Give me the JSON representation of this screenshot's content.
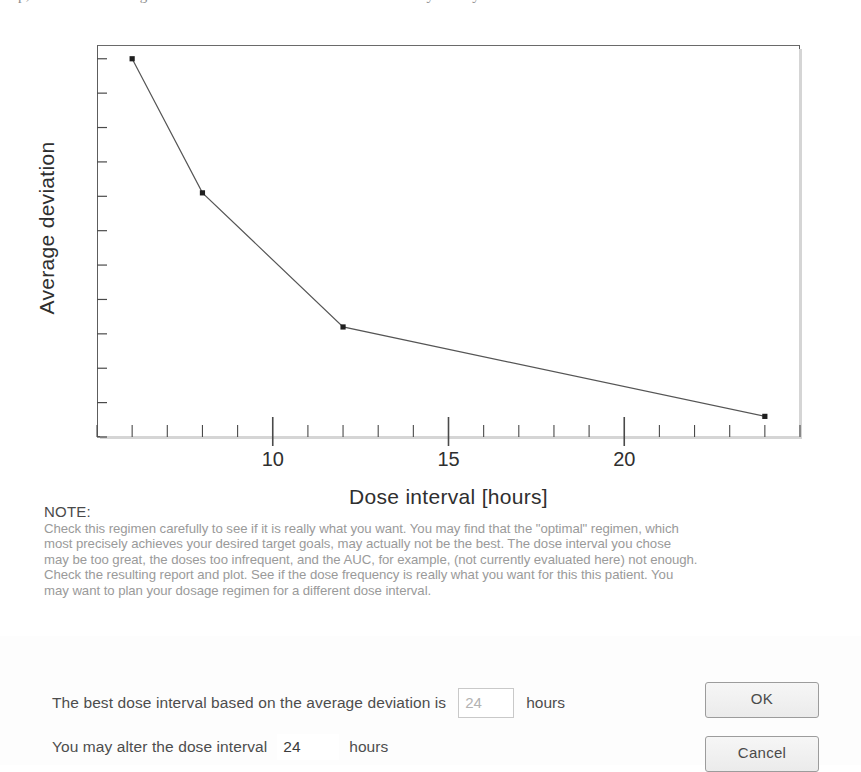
{
  "top_clipped_text": "p, and see the average deviation as a function of the dose interval you may want",
  "chart_data": {
    "type": "line",
    "title": "",
    "xlabel": "Dose interval [hours]",
    "ylabel": "Average deviation",
    "x": [
      6,
      8,
      12,
      24
    ],
    "values": [
      13.3,
      11.35,
      9.4,
      8.1
    ],
    "series": [
      {
        "name": "Average deviation vs dose interval",
        "x": [
          6,
          8,
          12,
          24
        ],
        "values": [
          13.3,
          11.35,
          9.4,
          8.1
        ]
      }
    ],
    "xlim": [
      5,
      25
    ],
    "ylim": [
      7.8,
      13.5
    ],
    "x_tick_labels": [
      "10",
      "15",
      "20"
    ],
    "x_tick_values": [
      10,
      15,
      20
    ],
    "x_minor_tick_step": 1,
    "y_tick_labels": [
      "8",
      "9",
      "10",
      "11",
      "12",
      "13"
    ],
    "y_tick_values": [
      8,
      9,
      10,
      11,
      12,
      13
    ],
    "y_minor_tick_step": 0.5,
    "grid": false,
    "legend": "none",
    "marker": "filled-square",
    "line_color": "#555555"
  },
  "note": {
    "heading": "NOTE:",
    "lines": [
      "Check this regimen carefully to see if it is really what you want. You may find that the \"optimal\" regimen, which",
      "most precisely achieves your desired target goals, may actually not be the best. The dose interval you chose",
      "may be too great, the doses too infrequent, and the AUC, for example, (not currently evaluated here) not enough.",
      "Check the resulting report and plot. See if the dose frequency is really what you want for this this patient. You",
      "may want to plan your dosage regimen for a different dose interval."
    ]
  },
  "form": {
    "best_interval": {
      "label": "The best dose interval based on the average deviation is",
      "value": "24",
      "unit": "hours"
    },
    "alter_interval": {
      "label": "You may alter the dose interval",
      "value": "24",
      "unit": "hours"
    }
  },
  "buttons": {
    "ok": "OK",
    "cancel": "Cancel"
  }
}
